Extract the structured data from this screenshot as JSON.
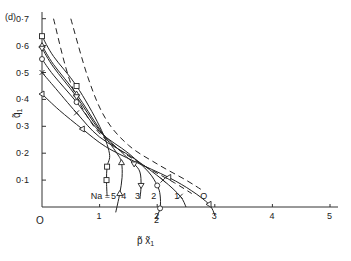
{
  "chart_data": {
    "type": "line",
    "panel_label": "(d)",
    "title": "",
    "xlabel": "p̃ x̃₁",
    "ylabel": "q̃₁",
    "xlim": [
      0,
      5
    ],
    "ylim": [
      0,
      0.7
    ],
    "x_ticks": [
      "1",
      "2",
      "3",
      "4",
      "5"
    ],
    "y_ticks": [
      "0·1",
      "0·2",
      "0·3",
      "0·4",
      "0·5",
      "0·6",
      "0·7"
    ],
    "origin_label": "O",
    "grid": false,
    "legend_prefix": "Na =",
    "series": [
      {
        "name": "Na = 5",
        "marker": "square",
        "style": "solid",
        "x": [
          0,
          0.2,
          0.6,
          1.0,
          1.17,
          1.13,
          1.12,
          1.13
        ],
        "y": [
          0.635,
          0.56,
          0.45,
          0.3,
          0.2,
          0.15,
          0.1,
          0.04
        ]
      },
      {
        "name": "Na = 4",
        "marker": "triangle",
        "style": "solid",
        "x": [
          0,
          0.2,
          0.6,
          1.0,
          1.3,
          1.38,
          1.39,
          1.35,
          1.28
        ],
        "y": [
          0.6,
          0.53,
          0.42,
          0.29,
          0.2,
          0.165,
          0.11,
          0.05,
          -0.02
        ]
      },
      {
        "name": "Na = 3",
        "marker": "inverted-triangle",
        "style": "solid",
        "x": [
          0,
          0.2,
          0.6,
          1.0,
          1.4,
          1.6,
          1.7,
          1.72,
          1.7
        ],
        "y": [
          0.59,
          0.52,
          0.41,
          0.285,
          0.2,
          0.16,
          0.13,
          0.08,
          0.03
        ]
      },
      {
        "name": "Na = 2",
        "marker": "circle",
        "style": "solid",
        "x": [
          0,
          0.2,
          0.6,
          1.0,
          1.5,
          1.85,
          2.0,
          2.05,
          2.05,
          1.98
        ],
        "y": [
          0.55,
          0.49,
          0.39,
          0.28,
          0.2,
          0.13,
          0.08,
          0.045,
          -0.005,
          -0.04
        ]
      },
      {
        "name": "Na = 1",
        "marker": "cross",
        "style": "solid",
        "x": [
          0,
          0.2,
          0.6,
          1.0,
          1.6,
          2.1,
          2.4,
          2.5
        ],
        "y": [
          0.5,
          0.45,
          0.35,
          0.26,
          0.18,
          0.1,
          0.04,
          0
        ]
      },
      {
        "name": "Na = 0",
        "marker": "triangle-left",
        "style": "solid",
        "x": [
          0,
          0.3,
          0.7,
          1.1,
          1.6,
          2.2,
          2.6,
          2.9,
          3.0
        ],
        "y": [
          0.42,
          0.36,
          0.29,
          0.225,
          0.17,
          0.11,
          0.06,
          0.01,
          -0.03
        ]
      },
      {
        "name": "limit (inner)",
        "marker": "none",
        "style": "dashed",
        "x": [
          0.2,
          0.5,
          0.9,
          1.3,
          1.8,
          2.3,
          2.6
        ],
        "y": [
          0.7,
          0.46,
          0.3,
          0.22,
          0.15,
          0.09,
          0.05
        ]
      },
      {
        "name": "limit (outer)",
        "marker": "none",
        "style": "dashed",
        "x": [
          0.5,
          0.8,
          1.1,
          1.5,
          2.0,
          2.5,
          2.8
        ],
        "y": [
          0.7,
          0.48,
          0.33,
          0.23,
          0.16,
          0.1,
          0.06
        ]
      }
    ],
    "annotations": [
      {
        "text": "Na =",
        "x": 0.95,
        "y": 0.04
      },
      {
        "text": "5",
        "x": 1.3,
        "y": 0.04
      },
      {
        "text": "4",
        "x": 1.48,
        "y": 0.04
      },
      {
        "text": "3",
        "x": 1.72,
        "y": 0.04
      },
      {
        "text": "2",
        "x": 2.0,
        "y": 0.04
      },
      {
        "text": "1",
        "x": 2.4,
        "y": 0.04
      },
      {
        "text": "O",
        "x": 2.85,
        "y": 0.04
      },
      {
        "text": "2",
        "x": 2.05,
        "y": -0.05
      }
    ]
  },
  "labels": {
    "panel": "(d)",
    "ylabel_main": "q̃",
    "ylabel_sub": "1",
    "xlabel_main": "p̃ x̃",
    "xlabel_sub": "1",
    "origin": "O",
    "na_prefix": "Na =",
    "na_values": [
      "5",
      "4",
      "3",
      "2",
      "1",
      "O"
    ],
    "below_axis_two": "2"
  }
}
